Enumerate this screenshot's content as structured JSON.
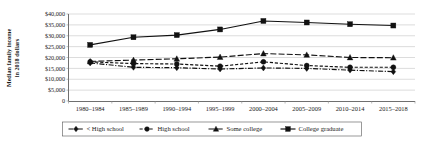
{
  "chart_data": {
    "type": "line",
    "title": "",
    "xlabel": "",
    "ylabel": "Median family income in 2018 dollars",
    "ylabel_line1": "Median family income",
    "ylabel_line2": "in 2018 dollars",
    "categories": [
      "1980–1984",
      "1985–1989",
      "1990–1994",
      "1995–1999",
      "2000–2004",
      "2005–2009",
      "2010–2014",
      "2015–2018"
    ],
    "ylim": [
      0,
      40000
    ],
    "ytick_values": [
      0,
      5000,
      10000,
      15000,
      20000,
      25000,
      30000,
      35000,
      40000
    ],
    "ytick_labels": [
      "0",
      "$5,000",
      "$10,000",
      "$15,000",
      "$20,000",
      "$25,000",
      "$30,000",
      "$35,000",
      "$40,000"
    ],
    "grid": true,
    "legend_position": "bottom",
    "series": [
      {
        "name": "< High school",
        "marker": "diamond",
        "dash": "dash-dot",
        "values": [
          17500,
          15500,
          15300,
          14700,
          15200,
          15000,
          14200,
          13500
        ]
      },
      {
        "name": "High school",
        "marker": "circle",
        "dash": "dashed",
        "values": [
          18000,
          17200,
          17000,
          16000,
          18000,
          16300,
          15500,
          15500
        ]
      },
      {
        "name": "Some college",
        "marker": "triangle",
        "dash": "long-dash",
        "values": [
          18200,
          18800,
          19400,
          20200,
          21800,
          21200,
          20000,
          19900
        ]
      },
      {
        "name": "College graduate",
        "marker": "square",
        "dash": "solid",
        "values": [
          25800,
          29300,
          30300,
          32900,
          36800,
          36100,
          35300,
          34700
        ]
      }
    ]
  },
  "legend": {
    "entries": [
      {
        "label": "< High school",
        "marker": "diamond"
      },
      {
        "label": "High school",
        "marker": "circle"
      },
      {
        "label": "Some college",
        "marker": "triangle"
      },
      {
        "label": "College graduate",
        "marker": "square"
      }
    ]
  }
}
